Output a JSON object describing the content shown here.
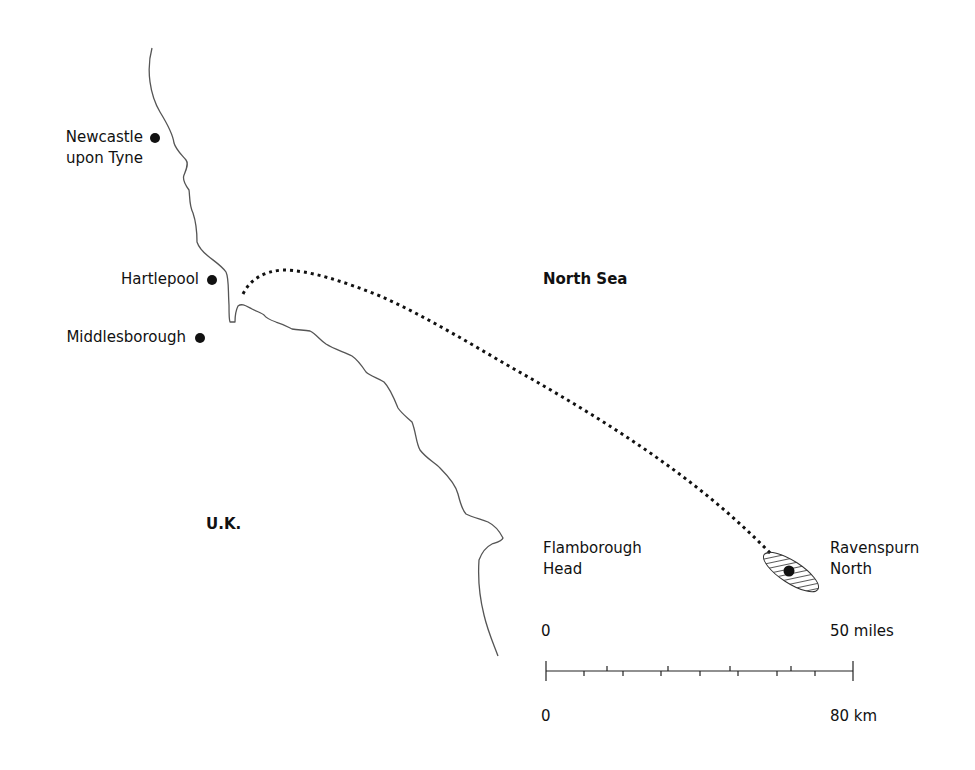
{
  "map": {
    "regions": {
      "land": "U.K.",
      "sea": "North Sea"
    },
    "places": [
      {
        "name": "Newcastle upon Tyne",
        "line1": "Newcastle",
        "line2": "upon Tyne",
        "type": "city"
      },
      {
        "name": "Hartlepool",
        "line1": "Hartlepool",
        "type": "city"
      },
      {
        "name": "Middlesborough",
        "line1": "Middlesborough",
        "type": "city"
      },
      {
        "name": "Flamborough Head",
        "line1": "Flamborough",
        "line2": "Head",
        "type": "headland"
      },
      {
        "name": "Ravenspurn North",
        "line1": "Ravenspurn",
        "line2": "North",
        "type": "gas-field"
      }
    ],
    "route": {
      "from": "Hartlepool",
      "to": "Ravenspurn North",
      "style": "dotted"
    },
    "scale_bar": {
      "miles": {
        "start_label": "0",
        "end_label": "50 miles",
        "tick_interval": 10
      },
      "km": {
        "start_label": "0",
        "end_label": "80 km",
        "tick_interval": 10
      }
    },
    "colors": {
      "ink": "#111111",
      "coast": "#555555",
      "background": "#ffffff"
    }
  }
}
